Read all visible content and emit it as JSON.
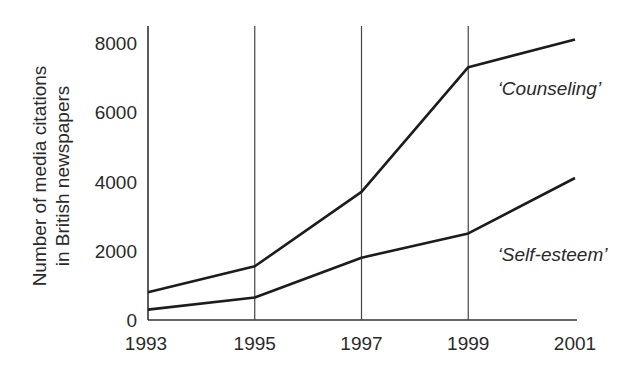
{
  "chart_data": {
    "type": "line",
    "title": "",
    "xlabel": "",
    "ylabel": "Number of media citations in British newspapers",
    "ylabel_lines": [
      "Number of media citations",
      "in British newspapers"
    ],
    "x": [
      1993,
      1995,
      1997,
      1999,
      2001
    ],
    "x_tick_labels": [
      "1993",
      "1995",
      "1997",
      "1999",
      "2001"
    ],
    "y_ticks": [
      0,
      2000,
      4000,
      6000,
      8000
    ],
    "y_tick_labels": [
      "0",
      "2000",
      "4000",
      "6000",
      "8000"
    ],
    "ylim": [
      0,
      8000
    ],
    "grid": {
      "vertical_lines_at": [
        1995,
        1997,
        1999
      ],
      "horizontal": false
    },
    "legend": "inline annotations",
    "series": [
      {
        "name": "Counseling",
        "label": "‘Counseling’",
        "values": [
          800,
          1550,
          3700,
          7300,
          8100
        ],
        "label_anchor": {
          "x": 2000.0,
          "y": 6700
        }
      },
      {
        "name": "Self-esteem",
        "label": "‘Self-esteem’",
        "values": [
          300,
          650,
          1800,
          2500,
          4100
        ],
        "label_anchor": {
          "x": 2000.0,
          "y": 1900
        }
      }
    ],
    "annotations": [
      "‘Counseling’",
      "‘Self-esteem’"
    ]
  },
  "colors": {
    "line": "#1c1c1c",
    "axis": "#333333",
    "text": "#2a2a2a",
    "background": "#ffffff"
  }
}
